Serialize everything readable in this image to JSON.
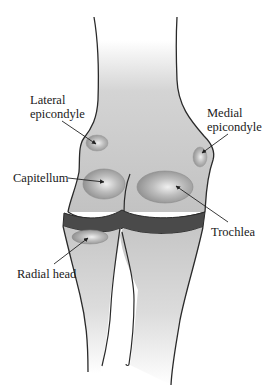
{
  "diagram": {
    "colors": {
      "bone_fill": "#c4c4c4",
      "bone_light": "#f4f4f4",
      "outline": "#2a2a2a",
      "cartilage_band": "#4a4a4a",
      "ossification_dark": "#8c8c8c",
      "ossification_light": "#e6e6e6",
      "arrow": "#222222",
      "text": "#1a1a1a"
    },
    "labels": {
      "lateral_epicondyle": {
        "line1": "Lateral",
        "line2": "epicondyle"
      },
      "medial_epicondyle": {
        "line1": "Medial",
        "line2": "epicondyle"
      },
      "capitellum": "Capitellum",
      "trochlea": "Trochlea",
      "radial_head": "Radial head"
    },
    "structures": [
      "humerus",
      "radius",
      "ulna",
      "cartilage-band"
    ]
  }
}
